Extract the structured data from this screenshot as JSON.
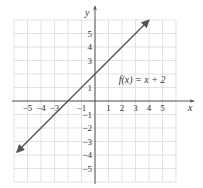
{
  "chart_data": {
    "type": "line",
    "title": "",
    "annotation": "f(x) = x + 2",
    "xlabel": "x",
    "ylabel": "y",
    "xlim": [
      -6,
      6
    ],
    "ylim": [
      -6,
      6
    ],
    "grid": true,
    "x_ticks": [
      -5,
      -4,
      -3,
      -1,
      1,
      2,
      3,
      4,
      5
    ],
    "y_ticks": [
      5,
      4,
      3,
      1,
      -1,
      -2,
      -3,
      -4,
      -5
    ],
    "x_tick_labels": [
      "−5",
      "−4",
      "−3",
      "−1",
      "1",
      "2",
      "3",
      "4",
      "5"
    ],
    "y_tick_labels": [
      "5",
      "4",
      "3",
      "1",
      "−1",
      "−2",
      "−3",
      "−4",
      "−5"
    ],
    "series": [
      {
        "name": "f(x) = x + 2",
        "equation": "y = x + 2",
        "x": [
          -5.8,
          4
        ],
        "y": [
          -3.8,
          6
        ],
        "arrows": "both"
      }
    ]
  }
}
